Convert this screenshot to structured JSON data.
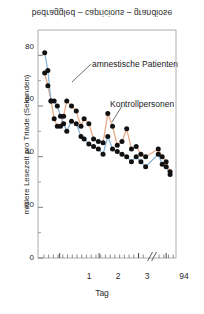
{
  "figure": {
    "top_caption": "bedraggled – capricious – grandiose",
    "top_caption_orientation": "vertically-mirrored"
  },
  "chart_data": {
    "type": "scatter",
    "title": "bedraggled – capricious – grandiose",
    "xlabel": "Tag",
    "ylabel": "mittlere Lesezeit pro Triade (Sekunden)",
    "xlim": [
      0.45,
      3.95
    ],
    "ylim": [
      0,
      90
    ],
    "yticks": [
      0,
      20,
      40,
      60,
      80
    ],
    "ytick_labels": [
      "0",
      "20",
      "40",
      "60",
      "80"
    ],
    "xticks": [
      1,
      2,
      3,
      3.7
    ],
    "xtick_labels": [
      "1",
      "2",
      "3",
      "94"
    ],
    "axis_break": true,
    "axis_break_position": 3.33,
    "grid": false,
    "legend": "annotations",
    "annotations": [
      {
        "text": "amnestische Patienten",
        "points_to_series": "amnestische Patienten"
      },
      {
        "text": "Kontrollpersonen",
        "points_to_series": "Kontrollpersonen"
      }
    ],
    "series": [
      {
        "name": "amnestische Patienten",
        "color": "#e8a882",
        "marker": "filled-circle",
        "marker_color": "#111111",
        "x": [
          0.62,
          0.7,
          0.78,
          0.86,
          0.94,
          1.02,
          1.1,
          1.18,
          1.3,
          1.42,
          1.54,
          1.62,
          1.74,
          1.86,
          1.98,
          2.1,
          2.22,
          2.34,
          2.46,
          2.58,
          2.7,
          2.82,
          2.94,
          3.06,
          3.18,
          3.5,
          3.6,
          3.7,
          3.8
        ],
        "y": [
          73.0,
          68.0,
          62.0,
          55.0,
          52.0,
          52.0,
          56.0,
          62.0,
          60.0,
          58.0,
          52.0,
          55.0,
          53.0,
          47.0,
          46.0,
          45.5,
          57.0,
          52.0,
          44.5,
          46.0,
          51.0,
          43.0,
          44.0,
          41.0,
          40.0,
          43.0,
          40.0,
          38.0,
          34.0
        ]
      },
      {
        "name": "Kontrollpersonen",
        "color": "#86b4d8",
        "marker": "filled-circle",
        "marker_color": "#111111",
        "x": [
          0.62,
          0.7,
          0.78,
          0.86,
          0.94,
          1.02,
          1.1,
          1.18,
          1.3,
          1.42,
          1.54,
          1.62,
          1.74,
          1.86,
          1.98,
          2.1,
          2.22,
          2.34,
          2.46,
          2.58,
          2.7,
          2.82,
          2.94,
          3.06,
          3.18,
          3.5,
          3.6,
          3.7,
          3.8
        ],
        "y": [
          81.0,
          74.0,
          62.0,
          62.0,
          60.0,
          56.0,
          53.0,
          50.0,
          54.0,
          53.0,
          48.0,
          47.0,
          45.0,
          44.0,
          43.0,
          41.0,
          48.0,
          43.0,
          42.0,
          41.0,
          40.0,
          38.0,
          40.0,
          38.0,
          36.0,
          41.0,
          37.0,
          36.0,
          33.0
        ]
      }
    ]
  },
  "axes": {
    "ytick_labels": [
      "80",
      "60",
      "40",
      "20",
      "0"
    ],
    "xtick_labels": [
      "1",
      "2",
      "3",
      "94"
    ],
    "xlabel": "Tag",
    "ylabel": "mittlere Lesezeit pro Triade (Sekunden)"
  },
  "colors": {
    "series_patients": "#e8a882",
    "series_controls": "#86b4d8",
    "marker": "#111111",
    "axis": "#6e6e6e",
    "text": "#2b2b2b",
    "background": "#ffffff"
  }
}
